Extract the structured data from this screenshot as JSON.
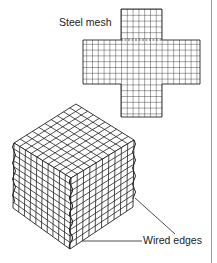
{
  "diagram": {
    "labels": {
      "steel_mesh": "Steel mesh",
      "wired_edges": "Wired edges"
    },
    "components": [
      {
        "name": "flat-mesh-net",
        "shape": "cross",
        "description": "Unfolded steel mesh net of a cube"
      },
      {
        "name": "folded-mesh-cube",
        "shape": "cube",
        "description": "Mesh folded into a cube with wired edges"
      }
    ],
    "colors": {
      "line": "#222222",
      "rule": "#9a9a9a",
      "background": "#ffffff"
    }
  }
}
